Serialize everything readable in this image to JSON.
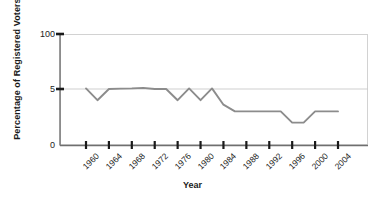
{
  "chart_data": {
    "type": "line",
    "title": "",
    "xlabel": "Year",
    "ylabel": "Percentage of Registered Voters",
    "xlim": [
      1959,
      2005
    ],
    "ylim": [
      0,
      100
    ],
    "yticks": [
      0,
      5,
      100
    ],
    "ytick_labels": [
      "0",
      "5",
      "100"
    ],
    "gridlines": [
      "5"
    ],
    "grid": true,
    "legend": "none",
    "xtick_labels": [
      "1960",
      "1964",
      "1968",
      "1972",
      "1976",
      "1980",
      "1984",
      "1988",
      "1992",
      "1996",
      "2000",
      "2004"
    ],
    "xticks": [
      1960,
      1964,
      1968,
      1972,
      1976,
      1980,
      1984,
      1988,
      1992,
      1996,
      2000,
      2004
    ],
    "series": [
      {
        "name": "Percentage of Registered Voters",
        "color": "#8c8c8c",
        "x": [
          1960,
          1962,
          1964,
          1966,
          1968,
          1970,
          1972,
          1974,
          1976,
          1978,
          1980,
          1982,
          1984,
          1986,
          1988,
          1990,
          1992,
          1994,
          1996,
          1998,
          2000,
          2002,
          2004
        ],
        "values": [
          6.0,
          4.0,
          5.0,
          5.6,
          6.0,
          7.0,
          5.0,
          5.0,
          4.0,
          6.0,
          4.0,
          6.0,
          3.6,
          3.0,
          3.0,
          3.0,
          3.0,
          3.0,
          2.0,
          2.0,
          3.0,
          3.0,
          3.0
        ]
      }
    ]
  },
  "axis": {
    "y_title": "Percentage of Registered Voters",
    "x_title": "Year"
  }
}
